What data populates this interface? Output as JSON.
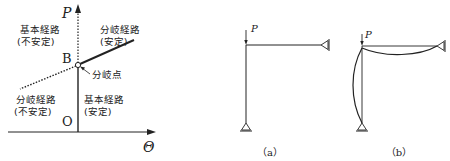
{
  "bifurcation_chart": {
    "axis_y_label": "P",
    "axis_x_label": "Θ",
    "origin_label": "O",
    "point_label": "B",
    "bifurcation_point_label": "分岐点",
    "regions": {
      "upper_left": {
        "line1": "基本経路",
        "line2": "(不安定)"
      },
      "upper_right": {
        "line1": "分岐経路",
        "line2": "(安定)"
      },
      "lower_left": {
        "line1": "分岐経路",
        "line2": "(不安定)"
      },
      "lower_right": {
        "line1": "基本経路",
        "line2": "(安定)"
      }
    }
  },
  "frame_a": {
    "load_label": "P",
    "caption": "（a）"
  },
  "frame_b": {
    "load_label": "P",
    "caption": "（b）"
  }
}
